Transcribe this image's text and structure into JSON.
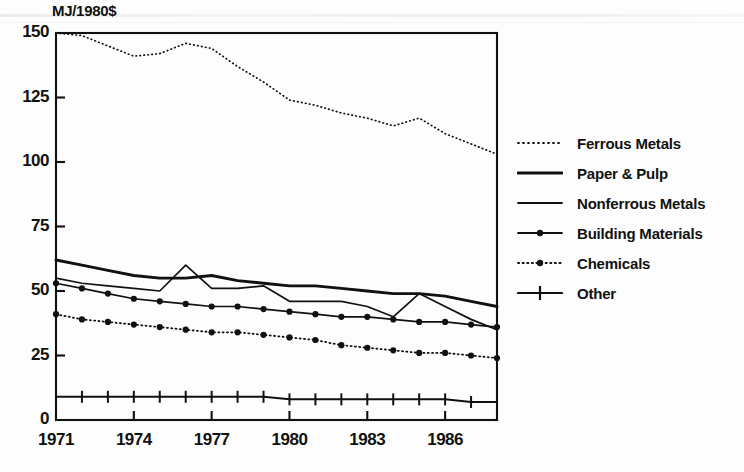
{
  "chart_data": {
    "type": "line",
    "title": "",
    "ylabel": "MJ/1980$",
    "xlabel": "",
    "ylim": [
      0,
      150
    ],
    "xlim": [
      1971,
      1988
    ],
    "yticks": [
      0,
      25,
      50,
      75,
      100,
      125,
      150
    ],
    "ytick_labels": [
      "0",
      "25",
      "50",
      "75",
      "100",
      "125",
      "150"
    ],
    "xticks": [
      1971,
      1974,
      1977,
      1980,
      1983,
      1986
    ],
    "xtick_labels": [
      "1971",
      "1974",
      "1977",
      "1980",
      "1983",
      "1986"
    ],
    "grid": false,
    "legend_position": "right",
    "x": [
      1971,
      1972,
      1973,
      1974,
      1975,
      1976,
      1977,
      1978,
      1979,
      1980,
      1981,
      1982,
      1983,
      1984,
      1985,
      1986,
      1987,
      1988
    ],
    "series": [
      {
        "name": "Ferrous Metals",
        "style": "fine-dotted",
        "marker": "none",
        "values": [
          150,
          149,
          145,
          141,
          142,
          146,
          144,
          137,
          131,
          124,
          122,
          119,
          117,
          114,
          117,
          111,
          107,
          103
        ]
      },
      {
        "name": "Paper & Pulp",
        "style": "thick-solid",
        "marker": "none",
        "values": [
          62,
          60,
          58,
          56,
          55,
          55,
          56,
          54,
          53,
          52,
          52,
          51,
          50,
          49,
          49,
          48,
          46,
          44
        ]
      },
      {
        "name": "Nonferrous Metals",
        "style": "thin-solid",
        "marker": "none",
        "values": [
          55,
          53,
          52,
          51,
          50,
          60,
          51,
          51,
          52,
          46,
          46,
          46,
          44,
          40,
          49,
          44,
          39,
          35
        ]
      },
      {
        "name": "Building Materials",
        "style": "solid-dot",
        "marker": "round",
        "values": [
          53,
          51,
          49,
          47,
          46,
          45,
          44,
          44,
          43,
          42,
          41,
          40,
          40,
          39,
          38,
          38,
          37,
          36
        ]
      },
      {
        "name": "Chemicals",
        "style": "dotted-dot",
        "marker": "round",
        "values": [
          41,
          39,
          38,
          37,
          36,
          35,
          34,
          34,
          33,
          32,
          31,
          29,
          28,
          27,
          26,
          26,
          25,
          24
        ]
      },
      {
        "name": "Other",
        "style": "solid-plus",
        "marker": "plus",
        "values": [
          9,
          9,
          9,
          9,
          9,
          9,
          9,
          9,
          9,
          8,
          8,
          8,
          8,
          8,
          8,
          8,
          7,
          7
        ]
      }
    ]
  },
  "colors": {
    "ink": "#111111",
    "background": "#fdfdfd"
  },
  "caption": ""
}
